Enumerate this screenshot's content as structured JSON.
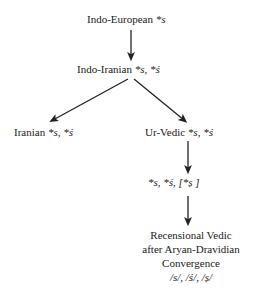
{
  "diagram": {
    "type": "family-tree",
    "background_color": "#ffffff",
    "text_color": "#1a1a1a",
    "arrow_color": "#222222",
    "nodes": [
      {
        "id": "indo-european",
        "label": "Indo-European",
        "segments": "*s",
        "full_text": "Indo-European *s"
      },
      {
        "id": "indo-iranian",
        "label": "Indo-Iranian",
        "segments": "*s, *ś",
        "full_text": "Indo-Iranian *s, *ś"
      },
      {
        "id": "iranian",
        "label": "Iranian",
        "segments": "*s, *ś",
        "full_text": "Iranian *s, *ś"
      },
      {
        "id": "ur-vedic",
        "label": "Ur-Vedic",
        "segments": "*s, *ś",
        "full_text": "Ur-Vedic *s, *ś"
      },
      {
        "id": "ur-vedic-reflex",
        "label": "",
        "segments": "*s, *ś, [*ṣ ]",
        "full_text": "*s, *ś, [*ṣ ]"
      },
      {
        "id": "recensional-vedic",
        "label": "Recensional Vedic after Aryan-Dravidian Convergence",
        "line1": "Recensional Vedic",
        "line2": "after Aryan-Dravidian",
        "line3": "Convergence",
        "phonemes": "/s/, /ś/, /ṣ/"
      }
    ],
    "edges": [
      {
        "from": "indo-european",
        "to": "indo-iranian",
        "style": "vertical-arrow"
      },
      {
        "from": "indo-iranian",
        "to": "iranian",
        "style": "diagonal-arrow-left"
      },
      {
        "from": "indo-iranian",
        "to": "ur-vedic",
        "style": "diagonal-arrow-right"
      },
      {
        "from": "ur-vedic",
        "to": "ur-vedic-reflex",
        "style": "vertical-arrow"
      },
      {
        "from": "ur-vedic-reflex",
        "to": "recensional-vedic",
        "style": "vertical-arrow"
      }
    ]
  }
}
